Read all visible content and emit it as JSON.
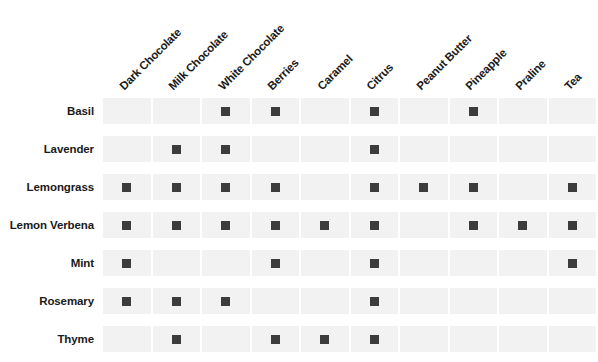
{
  "chart_data": {
    "type": "heatmap",
    "title": "",
    "subtitle": "",
    "xlabel": "",
    "ylabel": "",
    "grid": true,
    "legend_position": "none",
    "value_encoding": "binary presence marker (dark square = pairing present, empty = absent)",
    "marker_color": "#3c3c3c",
    "cell_color": "#f2f2f2",
    "background_color": "#ffffff",
    "columns": [
      "Dark Chocolate",
      "Milk Chocolate",
      "White Chocolate",
      "Berries",
      "Caramel",
      "Citrus",
      "Peanut Butter",
      "Pineapple",
      "Praline",
      "Tea"
    ],
    "rows": [
      "Basil",
      "Lavender",
      "Lemongrass",
      "Lemon Verbena",
      "Mint",
      "Rosemary",
      "Thyme"
    ],
    "series": [
      {
        "name": "Basil",
        "values": [
          0,
          0,
          1,
          1,
          0,
          1,
          0,
          1,
          0,
          0
        ]
      },
      {
        "name": "Lavender",
        "values": [
          0,
          1,
          1,
          0,
          0,
          1,
          0,
          0,
          0,
          0
        ]
      },
      {
        "name": "Lemongrass",
        "values": [
          1,
          1,
          1,
          1,
          0,
          1,
          1,
          1,
          0,
          1
        ]
      },
      {
        "name": "Lemon Verbena",
        "values": [
          1,
          1,
          1,
          1,
          1,
          1,
          0,
          1,
          1,
          1
        ]
      },
      {
        "name": "Mint",
        "values": [
          1,
          0,
          0,
          1,
          0,
          1,
          0,
          0,
          0,
          1
        ]
      },
      {
        "name": "Rosemary",
        "values": [
          1,
          1,
          1,
          0,
          0,
          1,
          0,
          0,
          0,
          0
        ]
      },
      {
        "name": "Thyme",
        "values": [
          0,
          1,
          0,
          1,
          1,
          1,
          0,
          0,
          0,
          0
        ]
      }
    ]
  }
}
